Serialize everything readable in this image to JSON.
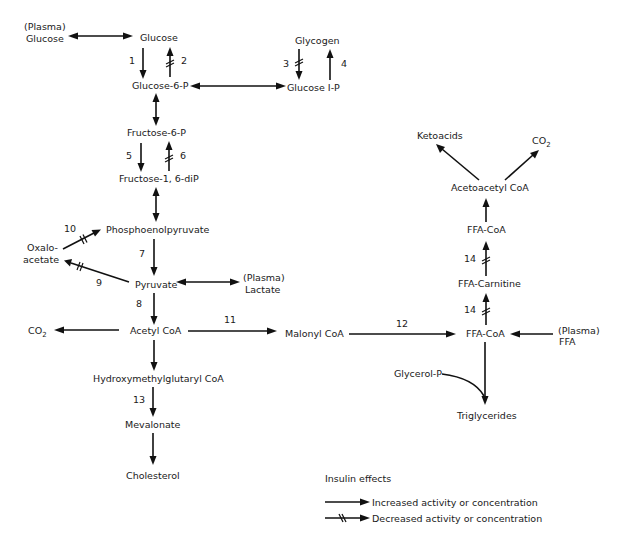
{
  "nodes": {
    "plasma_glucose": [
      "(Plasma)",
      "Glucose"
    ],
    "glucose": "Glucose",
    "glucose_6p": "Glucose-6-P",
    "glycogen": "Glycogen",
    "glucose_1p": "Glucose I-P",
    "fructose_6p": "Fructose-6-P",
    "fructose_16dip": "Fructose-1, 6-diP",
    "phosphoenolpyruvate": "Phosphoenolpyruvate",
    "oxaloacetate": [
      "Oxalo-",
      "acetate"
    ],
    "pyruvate": "Pyruvate",
    "plasma_lactate": [
      "(Plasma)",
      "Lactate"
    ],
    "co2_left": "CO",
    "co2_left_sub": "2",
    "acetyl_coa": "Acetyl CoA",
    "malonyl_coa": "Malonyl CoA",
    "hmg_coa": "Hydroxymethylglutaryl CoA",
    "mevalonate": "Mevalonate",
    "cholesterol": "Cholesterol",
    "ketoacids": "Ketoacids",
    "co2_right": "CO",
    "co2_right_sub": "2",
    "acetoacetyl_coa": "Acetoacetyl CoA",
    "ffa_coa_top": "FFA-CoA",
    "ffa_carnitine": "FFA-Carnitine",
    "ffa_coa": "FFA-CoA",
    "plasma_ffa": [
      "(Plasma)",
      "FFA"
    ],
    "glycerol_p": "Glycerol-P",
    "triglycerides": "Triglycerides"
  },
  "reactions": [
    {
      "id": "1",
      "from": "Glucose",
      "to": "Glucose-6-P",
      "effect": "increased"
    },
    {
      "id": "2",
      "from": "Glucose-6-P",
      "to": "Glucose",
      "effect": "decreased"
    },
    {
      "id": "3",
      "from": "Glycogen",
      "to": "Glucose I-P",
      "effect": "decreased"
    },
    {
      "id": "4",
      "from": "Glucose I-P",
      "to": "Glycogen",
      "effect": "increased"
    },
    {
      "id": "5",
      "from": "Fructose-6-P",
      "to": "Fructose-1, 6-diP",
      "effect": "increased"
    },
    {
      "id": "6",
      "from": "Fructose-1, 6-diP",
      "to": "Fructose-6-P",
      "effect": "decreased"
    },
    {
      "id": "7",
      "from": "Phosphoenolpyruvate",
      "to": "Pyruvate",
      "effect": "increased"
    },
    {
      "id": "8",
      "from": "Pyruvate",
      "to": "Acetyl CoA",
      "effect": "increased"
    },
    {
      "id": "9",
      "from": "Pyruvate",
      "to": "Oxaloacetate",
      "effect": "decreased"
    },
    {
      "id": "10",
      "from": "Oxaloacetate",
      "to": "Phosphoenolpyruvate",
      "effect": "decreased"
    },
    {
      "id": "11",
      "from": "Acetyl CoA",
      "to": "Malonyl CoA",
      "effect": "increased"
    },
    {
      "id": "12",
      "from": "Malonyl CoA",
      "to": "FFA-CoA",
      "effect": "increased"
    },
    {
      "id": "13",
      "from": "Hydroxymethylglutaryl CoA",
      "to": "Mevalonate",
      "effect": "increased"
    },
    {
      "id": "14",
      "from": "FFA-CoA",
      "to": "FFA-Carnitine",
      "effect": "decreased"
    },
    {
      "id": "14",
      "from": "FFA-Carnitine",
      "to": "FFA-CoA",
      "effect": "decreased"
    }
  ],
  "labels": {
    "r1": "1",
    "r2": "2",
    "r3": "3",
    "r4": "4",
    "r5": "5",
    "r6": "6",
    "r7": "7",
    "r8": "8",
    "r9": "9",
    "r10": "10",
    "r11": "11",
    "r12": "12",
    "r13": "13",
    "r14a": "14",
    "r14b": "14"
  },
  "legend": {
    "title": "Insulin effects",
    "increased": "Increased activity or concentration",
    "decreased": "Decreased activity or concentration"
  }
}
